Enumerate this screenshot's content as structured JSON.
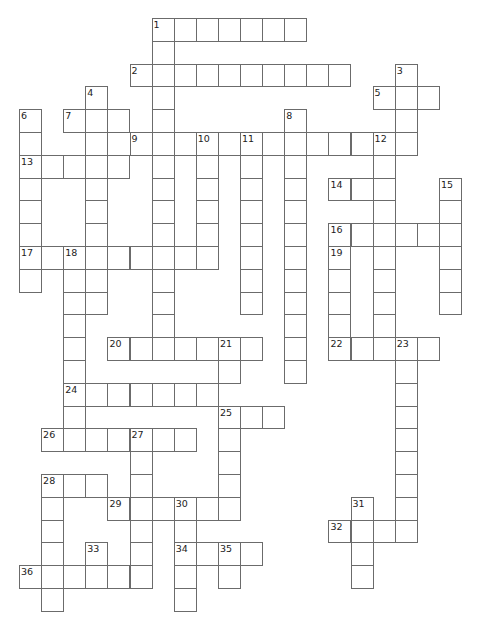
{
  "puzzle": {
    "type": "crossword",
    "cell_size": 22.1,
    "origin": {
      "x": 19,
      "y": 18
    },
    "row_height": 22.8,
    "colors": {
      "line": "#6b6b6b",
      "number": "#222222",
      "background": "#ffffff"
    },
    "words": [
      {
        "number": "1",
        "dir": "across",
        "row": 0,
        "col": 6,
        "len": 7
      },
      {
        "number": "1",
        "dir": "down",
        "row": 0,
        "col": 6,
        "len": 15
      },
      {
        "number": "2",
        "dir": "across",
        "row": 2,
        "col": 5,
        "len": 10
      },
      {
        "number": "3",
        "dir": "down",
        "row": 2,
        "col": 17,
        "len": 4
      },
      {
        "number": "4",
        "dir": "down",
        "row": 3,
        "col": 3,
        "len": 10
      },
      {
        "number": "5",
        "dir": "across",
        "row": 3,
        "col": 16,
        "len": 3
      },
      {
        "number": "6",
        "dir": "down",
        "row": 4,
        "col": 0,
        "len": 8
      },
      {
        "number": "7",
        "dir": "across",
        "row": 4,
        "col": 2,
        "len": 3
      },
      {
        "number": "8",
        "dir": "down",
        "row": 4,
        "col": 12,
        "len": 12
      },
      {
        "number": "9",
        "dir": "across",
        "row": 5,
        "col": 5,
        "len": 13
      },
      {
        "number": "10",
        "dir": "down",
        "row": 5,
        "col": 8,
        "len": 5
      },
      {
        "number": "11",
        "dir": "down",
        "row": 5,
        "col": 10,
        "len": 8
      },
      {
        "number": "12",
        "dir": "down",
        "row": 5,
        "col": 16,
        "len": 10
      },
      {
        "number": "13",
        "dir": "across",
        "row": 6,
        "col": 0,
        "len": 5
      },
      {
        "number": "14",
        "dir": "across",
        "row": 7,
        "col": 14,
        "len": 3
      },
      {
        "number": "15",
        "dir": "down",
        "row": 7,
        "col": 19,
        "len": 6
      },
      {
        "number": "16",
        "dir": "across",
        "row": 9,
        "col": 14,
        "len": 6
      },
      {
        "number": "17",
        "dir": "across",
        "row": 10,
        "col": 0,
        "len": 9
      },
      {
        "number": "18",
        "dir": "down",
        "row": 10,
        "col": 2,
        "len": 8
      },
      {
        "number": "19",
        "dir": "down",
        "row": 10,
        "col": 14,
        "len": 5
      },
      {
        "number": "20",
        "dir": "across",
        "row": 14,
        "col": 4,
        "len": 7
      },
      {
        "number": "21",
        "dir": "down",
        "row": 14,
        "col": 9,
        "len": 2
      },
      {
        "number": "22",
        "dir": "across",
        "row": 14,
        "col": 14,
        "len": 5
      },
      {
        "number": "23",
        "dir": "down",
        "row": 14,
        "col": 17,
        "len": 9
      },
      {
        "number": "24",
        "dir": "across",
        "row": 16,
        "col": 2,
        "len": 7
      },
      {
        "number": "25",
        "dir": "across",
        "row": 17,
        "col": 9,
        "len": 3
      },
      {
        "number": "25",
        "dir": "down",
        "row": 17,
        "col": 9,
        "len": 5
      },
      {
        "number": "26",
        "dir": "across",
        "row": 18,
        "col": 1,
        "len": 7
      },
      {
        "number": "27",
        "dir": "down",
        "row": 18,
        "col": 5,
        "len": 7
      },
      {
        "number": "28",
        "dir": "across",
        "row": 20,
        "col": 1,
        "len": 3
      },
      {
        "number": "28",
        "dir": "down",
        "row": 20,
        "col": 1,
        "len": 6
      },
      {
        "number": "29",
        "dir": "across",
        "row": 21,
        "col": 4,
        "len": 6
      },
      {
        "number": "30",
        "dir": "down",
        "row": 21,
        "col": 7,
        "len": 5
      },
      {
        "number": "31",
        "dir": "down",
        "row": 21,
        "col": 15,
        "len": 4
      },
      {
        "number": "32",
        "dir": "across",
        "row": 22,
        "col": 14,
        "len": 4
      },
      {
        "number": "33",
        "dir": "down",
        "row": 23,
        "col": 3,
        "len": 2
      },
      {
        "number": "34",
        "dir": "across",
        "row": 23,
        "col": 7,
        "len": 4
      },
      {
        "number": "35",
        "dir": "down",
        "row": 23,
        "col": 9,
        "len": 2
      },
      {
        "number": "36",
        "dir": "across",
        "row": 24,
        "col": 0,
        "len": 6
      }
    ]
  }
}
